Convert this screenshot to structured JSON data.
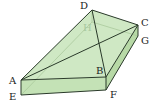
{
  "figure": {
    "type": "3d-solid-diagram",
    "colors": {
      "face_fill": "#cfe8c4",
      "face_fill_dark": "#b9dcab",
      "side_fill": "#c6e4b8",
      "edge": "#2a3a2a",
      "hidden_edge": "#9cc08f",
      "label": "#222222",
      "hidden_label": "#a8c8a0"
    },
    "vertices": {
      "A": {
        "label": "A",
        "x": 21,
        "y": 80
      },
      "B": {
        "label": "B",
        "x": 106,
        "y": 77
      },
      "C": {
        "label": "C",
        "x": 138,
        "y": 25
      },
      "D": {
        "label": "D",
        "x": 92,
        "y": 10
      },
      "E": {
        "label": "E",
        "x": 21,
        "y": 95
      },
      "F": {
        "label": "F",
        "x": 106,
        "y": 90
      },
      "G": {
        "label": "G",
        "x": 138,
        "y": 36
      },
      "H": {
        "label": "H",
        "x": 92,
        "y": 22
      }
    },
    "labels": {
      "A": "A",
      "B": "B",
      "C": "C",
      "D": "D",
      "E": "E",
      "F": "F",
      "G": "G",
      "H": "H"
    }
  }
}
